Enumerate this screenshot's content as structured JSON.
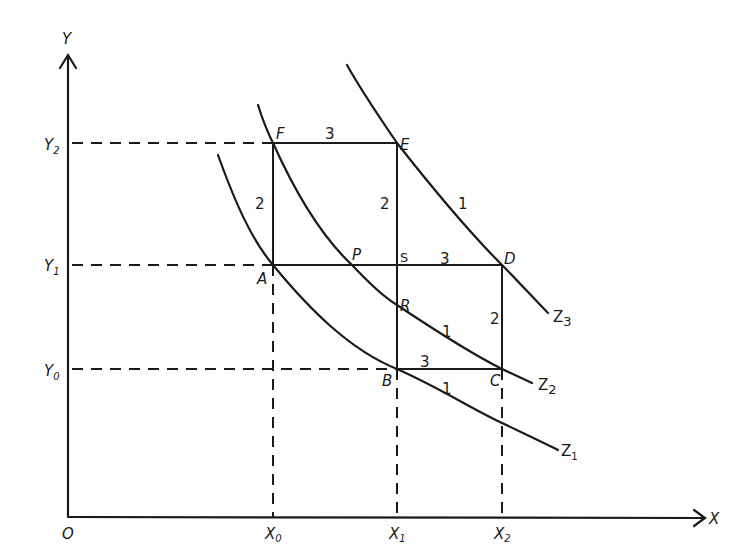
{
  "axes": {
    "y_label": "Y",
    "x_label": "X",
    "origin_label": "O"
  },
  "ticks": {
    "y": [
      {
        "base": "Y",
        "sub": "2"
      },
      {
        "base": "Y",
        "sub": "1"
      },
      {
        "base": "Y",
        "sub": "0"
      }
    ],
    "x": [
      {
        "base": "X",
        "sub": "0"
      },
      {
        "base": "X",
        "sub": "1"
      },
      {
        "base": "X",
        "sub": "2"
      }
    ]
  },
  "points": {
    "F": "F",
    "E": "E",
    "D": "D",
    "A": "A",
    "P": "P",
    "S": "S",
    "R": "R",
    "B": "B",
    "C": "C"
  },
  "segment_labels": {
    "FE": "3",
    "FA": "2",
    "ES": "2",
    "ED_curve": "1",
    "SD": "3",
    "DC": "2",
    "RC_curve": "1",
    "BC": "3",
    "B_curve_Z1": "1"
  },
  "curves": {
    "Z1": {
      "base": "Z",
      "sub": "1"
    },
    "Z2": {
      "base": "Z",
      "sub": "2"
    },
    "Z3": {
      "base": "Z",
      "sub": "3"
    }
  },
  "colors": {
    "ink": "#1a1a1a",
    "background": "#ffffff"
  }
}
